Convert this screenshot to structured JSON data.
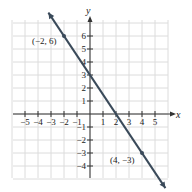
{
  "chart_data": {
    "type": "line",
    "title": "",
    "xlabel": "x",
    "ylabel": "y",
    "xlim": [
      -6,
      6
    ],
    "ylim": [
      -5,
      7
    ],
    "grid": true,
    "x_ticks": [
      -5,
      -4,
      -3,
      -2,
      -1,
      1,
      2,
      3,
      4,
      5
    ],
    "y_ticks": [
      -4,
      -3,
      -2,
      -1,
      1,
      2,
      3,
      4,
      5,
      6
    ],
    "x_tick_labels": [
      "−5",
      "−4",
      "−3",
      "−2",
      "−1",
      "1",
      "2",
      "3",
      "4",
      "5"
    ],
    "y_tick_labels": [
      "−4",
      "−3",
      "−2",
      "−1",
      "1",
      "2",
      "3",
      "4",
      "5",
      "6"
    ],
    "series": [
      {
        "name": "line",
        "equation": "y = -1.5x + 3",
        "slope": -1.5,
        "y_intercept": 3,
        "x_intercept": 2,
        "x": [
          -3.2,
          5.8
        ],
        "y": [
          7.8,
          -5.7
        ],
        "color": "#3a4a5a"
      }
    ],
    "points": [
      {
        "x": -2,
        "y": 6,
        "label": "(−2, 6)"
      },
      {
        "x": 4,
        "y": -3,
        "label": "(4, −3)"
      }
    ],
    "annotations": [
      "(−2, 6)",
      "(4, −3)"
    ]
  },
  "labels": {
    "x_axis": "x",
    "y_axis": "y",
    "point1": "(−2, 6)",
    "point2": "(4, −3)"
  }
}
